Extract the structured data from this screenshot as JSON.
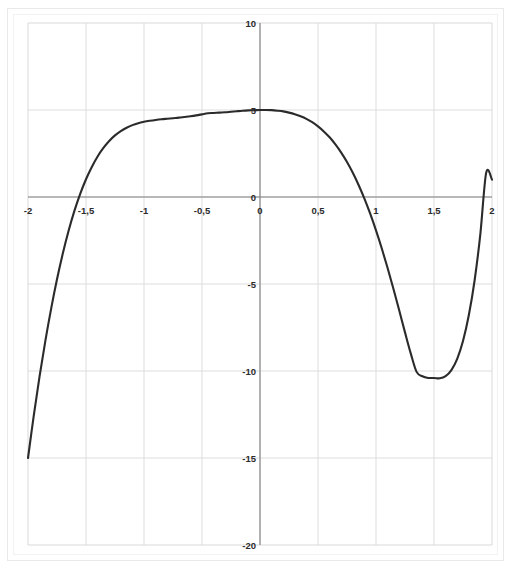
{
  "chart_data": {
    "type": "line",
    "title": "",
    "subtitle": "",
    "xlabel": "",
    "ylabel": "",
    "xlim": [
      -2,
      2
    ],
    "ylim": [
      -20,
      10
    ],
    "grid": true,
    "legend": null,
    "legend_position": "none",
    "x_tick_labels": [
      "-2",
      "-1,5",
      "-1",
      "-0,5",
      "0",
      "0,5",
      "1",
      "1,5",
      "2"
    ],
    "x_ticks": [
      -2,
      -1.5,
      -1,
      -0.5,
      0,
      0.5,
      1,
      1.5,
      2
    ],
    "y_tick_labels": [
      "10",
      "5",
      "0",
      "-5",
      "-10",
      "-15",
      "-20"
    ],
    "y_ticks": [
      10,
      5,
      0,
      -5,
      -10,
      -15,
      -20
    ],
    "decimal_separator": ",",
    "curve_color": "#2b2b2b",
    "grid_color": "#d9d9d9",
    "axis_color": "#808080",
    "background_color": "#ffffff",
    "series": [
      {
        "name": "f(x)",
        "x": [
          -2.0,
          -1.95,
          -1.9,
          -1.85,
          -1.8,
          -1.75,
          -1.7,
          -1.65,
          -1.6,
          -1.55,
          -1.5,
          -1.45,
          -1.4,
          -1.35,
          -1.3,
          -1.25,
          -1.2,
          -1.15,
          -1.1,
          -1.05,
          -1.0,
          -0.95,
          -0.9,
          -0.85,
          -0.8,
          -0.75,
          -0.7,
          -0.65,
          -0.6,
          -0.55,
          -0.5,
          -0.45,
          -0.4,
          -0.35,
          -0.3,
          -0.25,
          -0.2,
          -0.15,
          -0.1,
          -0.05,
          0.0,
          0.05,
          0.1,
          0.15,
          0.2,
          0.25,
          0.3,
          0.35,
          0.4,
          0.45,
          0.5,
          0.55,
          0.6,
          0.65,
          0.7,
          0.75,
          0.8,
          0.85,
          0.9,
          0.95,
          1.0,
          1.05,
          1.1,
          1.15,
          1.2,
          1.25,
          1.3,
          1.35,
          1.4,
          1.45,
          1.5,
          1.55,
          1.6,
          1.65,
          1.7,
          1.75,
          1.8,
          1.85,
          1.9,
          1.95,
          2.0
        ],
        "y": [
          -15.0,
          -12.55,
          -10.3,
          -8.25,
          -6.4,
          -4.73,
          -3.25,
          -1.94,
          -0.8,
          0.18,
          1.02,
          1.73,
          2.33,
          2.82,
          3.22,
          3.54,
          3.79,
          3.98,
          4.13,
          4.24,
          4.32,
          4.38,
          4.43,
          4.47,
          4.5,
          4.53,
          4.56,
          4.6,
          4.64,
          4.69,
          4.75,
          4.81,
          4.83,
          4.85,
          4.87,
          4.9,
          4.93,
          4.96,
          4.98,
          4.99,
          5.0,
          5.0,
          4.99,
          4.96,
          4.92,
          4.85,
          4.76,
          4.64,
          4.49,
          4.3,
          4.06,
          3.77,
          3.43,
          3.02,
          2.55,
          2.01,
          1.39,
          0.69,
          -0.09,
          -0.96,
          -1.92,
          -2.96,
          -4.08,
          -5.27,
          -6.51,
          -7.78,
          -9.0,
          -10.05,
          -10.3,
          -10.4,
          -10.4,
          -10.42,
          -10.3,
          -9.95,
          -9.3,
          -8.28,
          -6.8,
          -4.8,
          -2.1,
          1.4,
          1.0
        ]
      }
    ],
    "annotations": {
      "local_maximum": {
        "x": -1.27,
        "y": 7.72
      },
      "local_minimum": {
        "x": 1.55,
        "y": -10.42
      },
      "y_intercept": {
        "x": 0,
        "y": 5.0
      },
      "x_intercepts": [
        -1.58,
        0.8,
        1.96
      ]
    }
  },
  "plot_geometry": {
    "left_px": 28,
    "right_px": 492,
    "top_px": 23,
    "bottom_px": 545
  }
}
